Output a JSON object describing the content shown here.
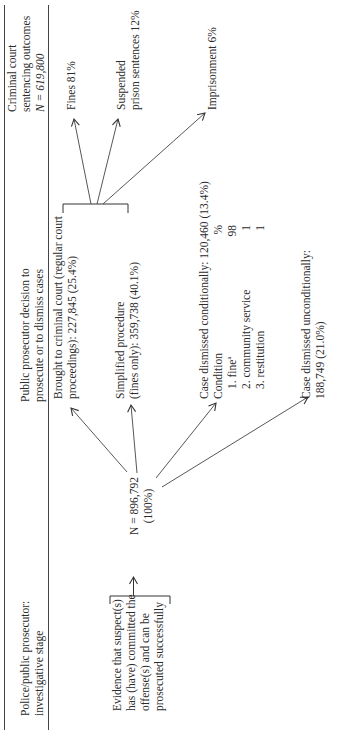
{
  "headers": {
    "col1": [
      "Police/public prosecutor:",
      "investigative stage"
    ],
    "col2": [
      "Public prosecutor decision to",
      "prosecute or to dismiss cases"
    ],
    "col3": [
      "Criminal court",
      "sentencing outcomes",
      "N = 619,800"
    ]
  },
  "evidence": {
    "lines": [
      "Evidence that suspect(s)",
      "has (have) committed the",
      "offense(s) and can be",
      "prosecuted successfully"
    ]
  },
  "total": {
    "lines": [
      "N = 896,792",
      "(100%)"
    ]
  },
  "decisions": {
    "criminal_court": [
      "Brought to criminal court (regular court",
      "proceedings): 227,845 (25.4%)"
    ],
    "simplified": [
      "Simplified procedure",
      "(fines only): 359,738 (40.1%)"
    ],
    "dismissed_conditionally": {
      "title": "Case dismissed conditionally: 120,460 (13.4%)",
      "condition_label": "Condition",
      "pct_header": "%",
      "rows": [
        {
          "label": "1.  fine",
          "sup": "a",
          "value": "98"
        },
        {
          "label": "2.  community service",
          "sup": "",
          "value": "1"
        },
        {
          "label": "3.  restitution",
          "sup": "",
          "value": "1"
        }
      ]
    },
    "dismissed_unconditionally": [
      "Case dismissed unconditionally:",
      "188,749 (21.0%)"
    ]
  },
  "outcomes": {
    "fines": "Fines 81%",
    "suspended": [
      "Suspended",
      "prison sentences 12%"
    ],
    "imprisonment": "Imprisonment 6%"
  },
  "colors": {
    "text": "#2b2b2b",
    "lines": "#3a3a3a"
  }
}
